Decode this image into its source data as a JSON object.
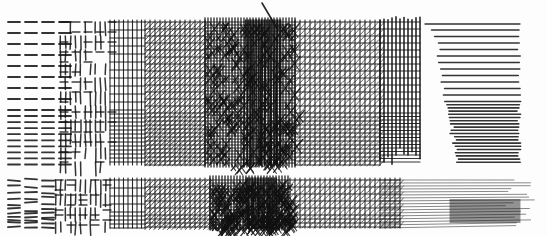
{
  "image": {
    "description": "Pen-and-ink hatching and cross-hatching value study in two horizontal bands",
    "ink_color": "#111111",
    "paper_color": "#fdfdfd",
    "bands": [
      {
        "name": "top-band",
        "y_range": [
          22,
          165
        ],
        "sections": [
          {
            "name": "dashes",
            "x_range": [
              8,
              60
            ],
            "technique": "horizontal dashes"
          },
          {
            "name": "broken-grid",
            "x_range": [
              60,
              110
            ],
            "technique": "broken vertical/horizontal strokes"
          },
          {
            "name": "grid",
            "x_range": [
              110,
              145
            ],
            "technique": "cross-hatch grid"
          },
          {
            "name": "diagonal-grid",
            "x_range": [
              145,
              205
            ],
            "technique": "grid with diagonal hatching"
          },
          {
            "name": "dense-dark",
            "x_range": [
              205,
              295
            ],
            "technique": "dense multi-direction hatching (darkest)"
          },
          {
            "name": "diagonal-grid-light",
            "x_range": [
              295,
              380
            ],
            "technique": "grid with diagonal hatching"
          },
          {
            "name": "vertical-grid",
            "x_range": [
              380,
              420
            ],
            "technique": "vertical strokes over horizontals"
          },
          {
            "name": "horizontal-lines",
            "x_range": [
              420,
              525
            ],
            "technique": "horizontal parallel lines"
          }
        ]
      },
      {
        "name": "bottom-band",
        "y_range": [
          180,
          228
        ],
        "sections": [
          {
            "name": "loose-dashes",
            "x_range": [
              8,
              55
            ],
            "technique": "loose hand-drawn dashes"
          },
          {
            "name": "woven-grid",
            "x_range": [
              55,
              110
            ],
            "technique": "basket-weave cross-hatch"
          },
          {
            "name": "grid",
            "x_range": [
              110,
              145
            ],
            "technique": "cross-hatch grid"
          },
          {
            "name": "diagonal-grid",
            "x_range": [
              145,
              210
            ],
            "technique": "grid with diagonal hatching"
          },
          {
            "name": "dense-dark",
            "x_range": [
              210,
              290
            ],
            "technique": "dense multi-direction hatching (darkest)"
          },
          {
            "name": "diagonal-grid-light",
            "x_range": [
              290,
              400
            ],
            "technique": "fading diagonal grid"
          },
          {
            "name": "fading-lines",
            "x_range": [
              400,
              535
            ],
            "technique": "tapering horizontal lines"
          }
        ]
      }
    ]
  }
}
